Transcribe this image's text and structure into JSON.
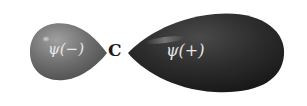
{
  "diagram": {
    "type": "sp-hybrid-orbital",
    "nucleus_label": "C",
    "lobes": [
      {
        "name": "small-lobe",
        "label": "ψ(−)",
        "color": "#6e6e6e",
        "side": "left"
      },
      {
        "name": "large-lobe",
        "label": "ψ(+)",
        "color": "#2a2a2a",
        "side": "right"
      }
    ],
    "background": "#ffffff"
  }
}
